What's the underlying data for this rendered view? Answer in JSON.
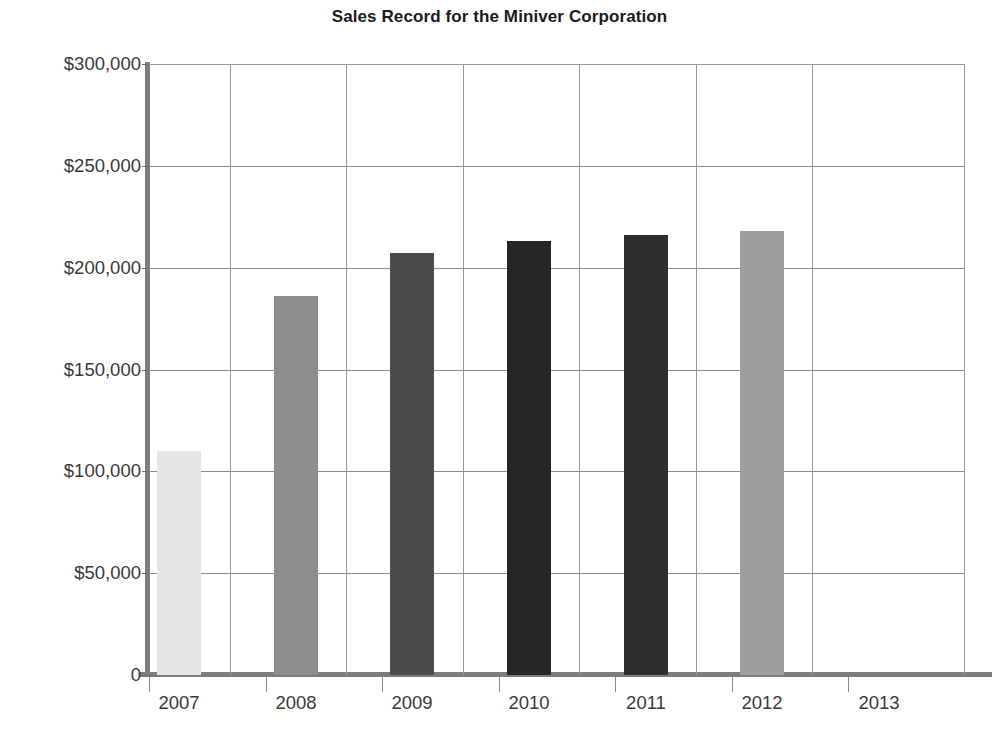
{
  "chart_data": {
    "type": "bar",
    "title": "Sales Record for the Miniver Corporation",
    "xlabel": "",
    "ylabel": "",
    "categories": [
      "2007",
      "2008",
      "2009",
      "2010",
      "2011",
      "2012",
      "2013"
    ],
    "values": [
      110000,
      186000,
      207000,
      213000,
      216000,
      218000,
      0
    ],
    "ylim": [
      0,
      300000
    ],
    "ytick_values": [
      0,
      50000,
      100000,
      150000,
      200000,
      250000,
      300000
    ],
    "ytick_labels": [
      "0",
      "$50,000",
      "$100,000",
      "$150,000",
      "$200,000",
      "$250,000",
      "$300,000"
    ],
    "bar_colors": [
      "#e6e6e6",
      "#8d8d8d",
      "#4b4b4b",
      "#262626",
      "#2e2e2e",
      "#9e9e9e",
      "#ffffff"
    ],
    "grid": true,
    "legend": "none",
    "currency_prefix": "$"
  },
  "axes": {
    "y_axis_name": "Sales in dollars",
    "x_axis_name": "Year"
  }
}
